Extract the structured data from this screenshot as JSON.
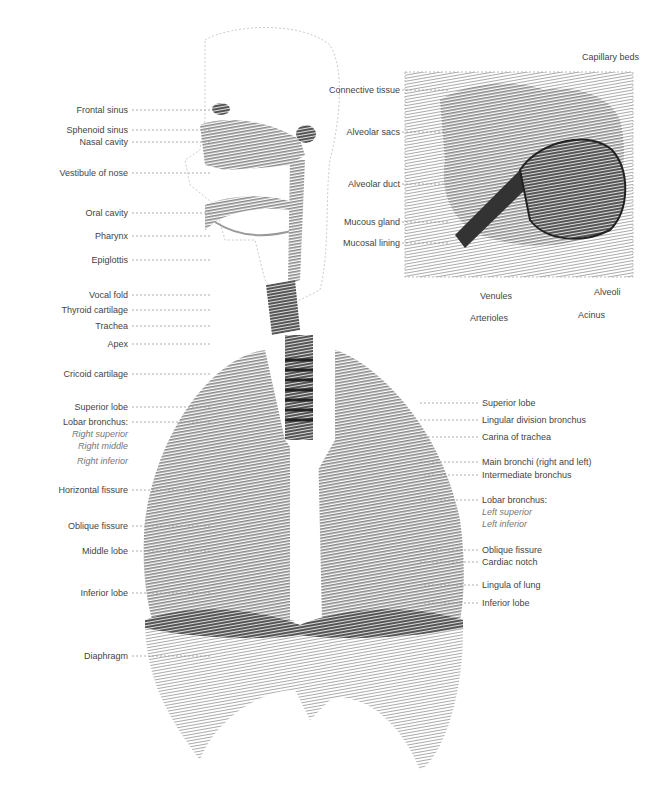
{
  "left_labels": [
    {
      "text": "Frontal sinus",
      "y": 110
    },
    {
      "text": "Sphenoid sinus",
      "y": 130
    },
    {
      "text": "Nasal cavity",
      "y": 142
    },
    {
      "text": "Vestibule of nose",
      "y": 173
    },
    {
      "text": "Oral cavity",
      "y": 213
    },
    {
      "text": "Pharynx",
      "y": 236
    },
    {
      "text": "Epiglottis",
      "y": 260
    },
    {
      "text": "Vocal fold",
      "y": 295
    },
    {
      "text": "Thyroid cartilage",
      "y": 310
    },
    {
      "text": "Trachea",
      "y": 326
    },
    {
      "text": "Apex",
      "y": 344
    },
    {
      "text": "Cricoid cartilage",
      "y": 374
    },
    {
      "text": "Superior lobe",
      "y": 407
    },
    {
      "text": "Lobar bronchus:",
      "y": 422
    },
    {
      "text": "Right superior",
      "y": 434,
      "italic": true
    },
    {
      "text": "Right middle",
      "y": 446,
      "italic": true
    },
    {
      "text": "Right inferior",
      "y": 461,
      "italic": true
    },
    {
      "text": "Horizontal fissure",
      "y": 490
    },
    {
      "text": "Oblique fissure",
      "y": 526
    },
    {
      "text": "Middle lobe",
      "y": 551
    },
    {
      "text": "Inferior lobe",
      "y": 593
    },
    {
      "text": "Diaphragm",
      "y": 656
    }
  ],
  "right_labels": [
    {
      "text": "Superior lobe",
      "y": 403
    },
    {
      "text": "Lingular division bronchus",
      "y": 420
    },
    {
      "text": "Carina of trachea",
      "y": 437
    },
    {
      "text": "Main bronchi (right and left)",
      "y": 462
    },
    {
      "text": "Intermediate bronchus",
      "y": 475
    },
    {
      "text": "Lobar bronchus:",
      "y": 500
    },
    {
      "text": "Left superior",
      "y": 512,
      "italic": true
    },
    {
      "text": "Left inferior",
      "y": 524,
      "italic": true
    },
    {
      "text": "Oblique fissure",
      "y": 550
    },
    {
      "text": "Cardiac notch",
      "y": 562
    },
    {
      "text": "Lingula of lung",
      "y": 585
    },
    {
      "text": "Inferior lobe",
      "y": 603
    }
  ],
  "inset": {
    "left_labels": [
      {
        "text": "Connective tissue",
        "y": 90
      },
      {
        "text": "Alveolar sacs",
        "y": 132
      },
      {
        "text": "Alveolar duct",
        "y": 184
      },
      {
        "text": "Mucous gland",
        "y": 222
      },
      {
        "text": "Mucosal lining",
        "y": 243
      }
    ],
    "top_label": "Capillary beds",
    "bottom_labels": [
      {
        "text": "Venules",
        "x": 480,
        "y": 296
      },
      {
        "text": "Arterioles",
        "x": 470,
        "y": 318
      },
      {
        "text": "Alveoli",
        "x": 594,
        "y": 292
      },
      {
        "text": "Acinus",
        "x": 578,
        "y": 315
      }
    ]
  },
  "colors": {
    "tissue": "#8a8a8a",
    "tissue_dark": "#5a5a5a",
    "tissue_light": "#c4c4c4",
    "label": "#444444",
    "leader": "#9a9a9a"
  }
}
